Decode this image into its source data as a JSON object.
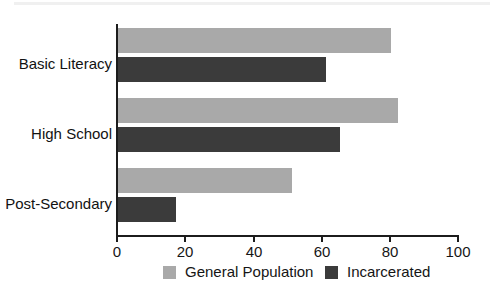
{
  "chart_data": {
    "type": "bar",
    "orientation": "horizontal",
    "title": "",
    "subtitle": "",
    "xlabel": "",
    "ylabel": "",
    "categories": [
      "Basic Literacy",
      "High School",
      "Post-Secondary"
    ],
    "series": [
      {
        "name": "General Population",
        "color": "#a9a9a9",
        "values": [
          80,
          82,
          51
        ]
      },
      {
        "name": "Incarcerated",
        "color": "#3b3b3b",
        "values": [
          61,
          65,
          17
        ]
      }
    ],
    "xlim": [
      0,
      100
    ],
    "xticks": [
      0,
      20,
      40,
      60,
      80,
      100
    ],
    "xtick_labels": [
      "0",
      "20",
      "40",
      "60",
      "80",
      "100"
    ],
    "grid": false,
    "legend_position": "bottom",
    "legend_entries": [
      "General Population",
      "Incarcerated"
    ]
  },
  "axis": {
    "line_color": "#1c1c1c"
  }
}
